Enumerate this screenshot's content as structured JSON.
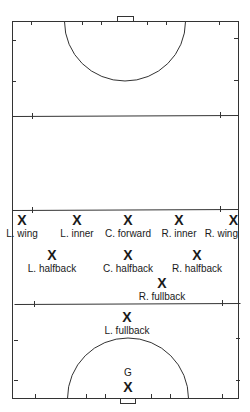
{
  "diagram": {
    "type": "field-hockey-positions",
    "colors": {
      "line": "#333333",
      "text": "#1a1a1a",
      "background": "#ffffff"
    },
    "field": {
      "left": 12,
      "right": 238,
      "top": 21,
      "bottom": 398,
      "line_25_top": 116,
      "center_line": 210,
      "line_25_bottom": 304
    },
    "players": [
      {
        "id": "l-wing",
        "mark": "X",
        "label": "L. wing",
        "x": 22,
        "y": 213
      },
      {
        "id": "l-inner",
        "mark": "X",
        "label": "L. inner",
        "x": 77,
        "y": 213
      },
      {
        "id": "c-forward",
        "mark": "X",
        "label": "C. forward",
        "x": 128,
        "y": 213
      },
      {
        "id": "r-inner",
        "mark": "X",
        "label": "R. inner",
        "x": 179,
        "y": 213
      },
      {
        "id": "r-wing",
        "mark": "X",
        "label": "R. wing",
        "x": 230,
        "y": 213
      },
      {
        "id": "l-halfback",
        "mark": "X",
        "label": "L. halfback",
        "x": 52,
        "y": 248
      },
      {
        "id": "c-halfback",
        "mark": "X",
        "label": "C. halfback",
        "x": 128,
        "y": 248
      },
      {
        "id": "r-halfback",
        "mark": "X",
        "label": "R. halfback",
        "x": 197,
        "y": 248
      },
      {
        "id": "r-fullback",
        "mark": "X",
        "label": "R. fullback",
        "x": 162,
        "y": 276
      },
      {
        "id": "l-fullback",
        "mark": "X",
        "label": "L. fullback",
        "x": 127,
        "y": 310
      },
      {
        "id": "goalkeeper",
        "mark": "X",
        "label": "G",
        "x": 128,
        "y": 368,
        "label_position": "above"
      }
    ]
  }
}
